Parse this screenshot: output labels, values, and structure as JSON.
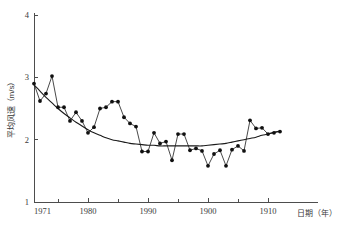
{
  "chart_data": {
    "type": "line",
    "title": "",
    "subtitle": "",
    "xlabel": "日期（年）",
    "ylabel": "平均风速（m/s）",
    "xlim": [
      1971,
      2013
    ],
    "ylim": [
      1,
      4
    ],
    "grid": false,
    "legend": null,
    "y_ticks": [
      "4",
      "3",
      "2",
      "1"
    ],
    "y_tick_values": [
      4,
      3,
      2,
      1
    ],
    "x_ticks": [
      "1971",
      "1980",
      "1990",
      "1900",
      "1910"
    ],
    "x_tick_values": [
      1971,
      1980,
      1990,
      2000,
      2010
    ],
    "x_minor_tick_values": [
      1975,
      1985,
      1995,
      2005
    ],
    "x": [
      1971,
      1972,
      1973,
      1974,
      1975,
      1976,
      1977,
      1978,
      1979,
      1980,
      1981,
      1982,
      1983,
      1984,
      1985,
      1986,
      1987,
      1988,
      1989,
      1990,
      1991,
      1992,
      1993,
      1994,
      1995,
      1996,
      1997,
      1998,
      1999,
      2000,
      2001,
      2002,
      2003,
      2004,
      2005,
      2006,
      2007,
      2008,
      2009,
      2010,
      2011,
      2012
    ],
    "series": [
      {
        "name": "年平均风速",
        "marker": "filled-circle",
        "values": [
          2.9,
          2.62,
          2.74,
          3.02,
          2.52,
          2.52,
          2.3,
          2.44,
          2.3,
          2.11,
          2.2,
          2.5,
          2.52,
          2.61,
          2.61,
          2.36,
          2.26,
          2.21,
          1.81,
          1.81,
          2.11,
          1.94,
          1.97,
          1.67,
          2.09,
          2.09,
          1.83,
          1.86,
          1.82,
          1.58,
          1.77,
          1.83,
          1.58,
          1.84,
          1.9,
          1.82,
          2.31,
          2.18,
          2.19,
          2.09,
          2.11,
          2.13
        ]
      },
      {
        "name": "趋势线",
        "type": "trend",
        "values": [
          2.88,
          2.78,
          2.68,
          2.59,
          2.5,
          2.42,
          2.35,
          2.28,
          2.22,
          2.16,
          2.11,
          2.07,
          2.03,
          2.0,
          1.98,
          1.96,
          1.94,
          1.93,
          1.92,
          1.91,
          1.91,
          1.9,
          1.9,
          1.9,
          1.9,
          1.9,
          1.9,
          1.9,
          1.9,
          1.91,
          1.92,
          1.93,
          1.94,
          1.96,
          1.98,
          2.0,
          2.02,
          2.04,
          2.07,
          2.09,
          2.12,
          2.14
        ]
      }
    ]
  }
}
